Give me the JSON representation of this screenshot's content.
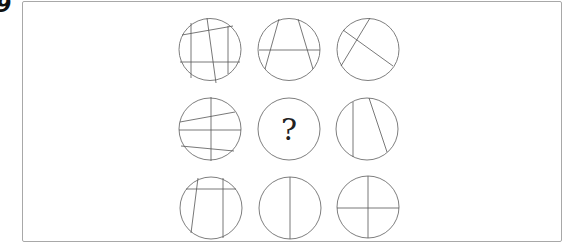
{
  "question_number": "9",
  "grid": {
    "rows": 3,
    "cols": 3,
    "missing_label": "?",
    "cells": [
      {
        "name": "cell-r1c1",
        "description": "4 lines: 2 near-horizontal, 2 near-vertical + 1 slanted"
      },
      {
        "name": "cell-r1c2",
        "description": "A shape: 2 slanted lines + 1 horizontal"
      },
      {
        "name": "cell-r1c3",
        "description": "2 crossing slanted lines"
      },
      {
        "name": "cell-r2c1",
        "description": "3 near-horizontal lines + 1 vertical"
      },
      {
        "name": "cell-r2c2",
        "description": "missing (question mark)"
      },
      {
        "name": "cell-r2c3",
        "description": "2 near-vertical lines"
      },
      {
        "name": "cell-r3c1",
        "description": "1 horizontal + 2 near-vertical lines"
      },
      {
        "name": "cell-r3c2",
        "description": "1 vertical line"
      },
      {
        "name": "cell-r3c3",
        "description": "1 horizontal + 1 vertical line (cross)"
      }
    ]
  }
}
